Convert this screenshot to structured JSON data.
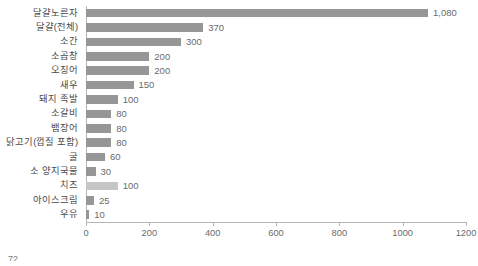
{
  "chart_data": {
    "type": "bar",
    "orientation": "horizontal",
    "title": "",
    "subtitle": "",
    "xlabel": "",
    "ylabel": "",
    "xlim": [
      0,
      1200
    ],
    "xticks": [
      0,
      200,
      400,
      600,
      800,
      1000,
      1200
    ],
    "xtick_labels": [
      "0",
      "200",
      "400",
      "600",
      "800",
      "1000",
      "1200"
    ],
    "grid": false,
    "legend": "none",
    "bar_color": "#969696",
    "highlight_color": "#c6c6c6",
    "categories": [
      "달걀노른자",
      "달걀(전체)",
      "소간",
      "소곱창",
      "오징어",
      "새우",
      "돼지 족발",
      "소갈비",
      "뱀장어",
      "닭고기(껍질 포함)",
      "굴",
      "소 양지국물",
      "치즈",
      "아이스크림",
      "우유"
    ],
    "values": [
      1080,
      370,
      300,
      200,
      200,
      150,
      100,
      80,
      80,
      80,
      60,
      30,
      100,
      25,
      10
    ],
    "value_labels": [
      "1,080",
      "370",
      "300",
      "200",
      "200",
      "150",
      "100",
      "80",
      "80",
      "80",
      "60",
      "30",
      "100",
      "25",
      "10"
    ],
    "highlighted_indices": [
      12
    ]
  },
  "footer": {
    "page_number": "72"
  }
}
